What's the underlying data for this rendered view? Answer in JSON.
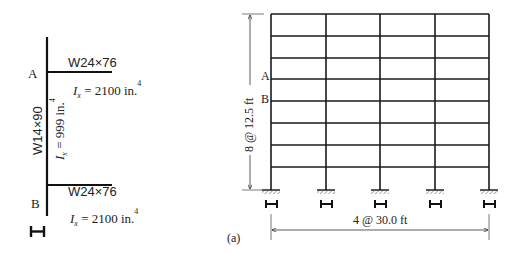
{
  "detail": {
    "column_label": "W14×90",
    "column_inertia": {
      "sym": "I",
      "sub": "x",
      "text": " = 999 in.",
      "sup": "4"
    },
    "beam_top": {
      "label": "W24×76",
      "inertia": {
        "sym": "I",
        "sub": "x",
        "text": " = 2100 in.",
        "sup": "4"
      }
    },
    "beam_bottom": {
      "label": "W24×76",
      "inertia": {
        "sym": "I",
        "sub": "x",
        "text": " = 2100 in.",
        "sup": "4"
      }
    },
    "joint_a": "A",
    "joint_b": "B",
    "section_icon": "wide-flange-section-icon"
  },
  "frame": {
    "stories": 8,
    "bays": 4,
    "height_dim": "8 @ 12.5 ft",
    "width_dim": "4 @ 30.0 ft",
    "joint_a": "A",
    "joint_b": "B",
    "part_label": "(a)",
    "support_type": "fixed",
    "line_color": "#1a1a1a"
  }
}
